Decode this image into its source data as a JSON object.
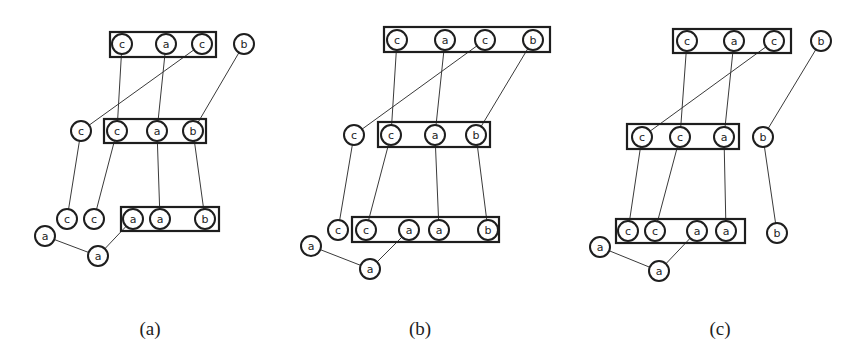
{
  "figure": {
    "node_radius": 10,
    "colors": {
      "stroke": "#1e1e1e",
      "edge": "#3a3a3a",
      "background": "#ffffff"
    },
    "panels": [
      {
        "id": "a",
        "caption": "(a)",
        "caption_pos": [
          150,
          328
        ],
        "boxes": [
          {
            "x": 110,
            "y": 32,
            "w": 106,
            "h": 25
          },
          {
            "x": 104,
            "y": 119,
            "w": 102,
            "h": 24
          },
          {
            "x": 121,
            "y": 207,
            "w": 98,
            "h": 24
          }
        ],
        "nodes": [
          {
            "id": "a_t1",
            "label": "c",
            "x": 122,
            "y": 44
          },
          {
            "id": "a_t2",
            "label": "a",
            "x": 166,
            "y": 44
          },
          {
            "id": "a_t3",
            "label": "c",
            "x": 202,
            "y": 44
          },
          {
            "id": "a_t4",
            "label": "b",
            "x": 244,
            "y": 44
          },
          {
            "id": "a_m0",
            "label": "c",
            "x": 81,
            "y": 131
          },
          {
            "id": "a_m1",
            "label": "c",
            "x": 117,
            "y": 131
          },
          {
            "id": "a_m2",
            "label": "a",
            "x": 157,
            "y": 131
          },
          {
            "id": "a_m3",
            "label": "b",
            "x": 193,
            "y": 131
          },
          {
            "id": "a_b0",
            "label": "c",
            "x": 67,
            "y": 219
          },
          {
            "id": "a_b1",
            "label": "c",
            "x": 94,
            "y": 219
          },
          {
            "id": "a_b2",
            "label": "a",
            "x": 133,
            "y": 219
          },
          {
            "id": "a_b3",
            "label": "a",
            "x": 160,
            "y": 219
          },
          {
            "id": "a_b4",
            "label": "b",
            "x": 205,
            "y": 219
          },
          {
            "id": "a_l1",
            "label": "a",
            "x": 45,
            "y": 236
          },
          {
            "id": "a_l2",
            "label": "a",
            "x": 98,
            "y": 256
          }
        ],
        "edges": [
          [
            "a_t1",
            "a_m1"
          ],
          [
            "a_t2",
            "a_m2"
          ],
          [
            "a_t3",
            "a_m0"
          ],
          [
            "a_t4",
            "a_m3"
          ],
          [
            "a_m0",
            "a_b0"
          ],
          [
            "a_m1",
            "a_b1"
          ],
          [
            "a_m2",
            "a_b3"
          ],
          [
            "a_m3",
            "a_b4"
          ],
          [
            "a_l1",
            "a_l2"
          ],
          [
            "a_l2",
            "a_b2"
          ]
        ]
      },
      {
        "id": "b",
        "caption": "(b)",
        "caption_pos": [
          420,
          328
        ],
        "boxes": [
          {
            "x": 384,
            "y": 27,
            "w": 166,
            "h": 25
          },
          {
            "x": 378,
            "y": 122,
            "w": 112,
            "h": 25
          },
          {
            "x": 352,
            "y": 217,
            "w": 147,
            "h": 25
          }
        ],
        "nodes": [
          {
            "id": "b_t1",
            "label": "c",
            "x": 397,
            "y": 40
          },
          {
            "id": "b_t2",
            "label": "a",
            "x": 445,
            "y": 40
          },
          {
            "id": "b_t3",
            "label": "c",
            "x": 485,
            "y": 40
          },
          {
            "id": "b_t4",
            "label": "b",
            "x": 533,
            "y": 40
          },
          {
            "id": "b_m0",
            "label": "c",
            "x": 354,
            "y": 135
          },
          {
            "id": "b_m1",
            "label": "c",
            "x": 391,
            "y": 135
          },
          {
            "id": "b_m2",
            "label": "a",
            "x": 435,
            "y": 135
          },
          {
            "id": "b_m3",
            "label": "b",
            "x": 476,
            "y": 135
          },
          {
            "id": "b_b0",
            "label": "c",
            "x": 338,
            "y": 230
          },
          {
            "id": "b_b1",
            "label": "c",
            "x": 366,
            "y": 230
          },
          {
            "id": "b_b2",
            "label": "a",
            "x": 409,
            "y": 230
          },
          {
            "id": "b_b3",
            "label": "a",
            "x": 439,
            "y": 230
          },
          {
            "id": "b_b4",
            "label": "b",
            "x": 488,
            "y": 230
          },
          {
            "id": "b_l1",
            "label": "a",
            "x": 311,
            "y": 246
          },
          {
            "id": "b_l2",
            "label": "a",
            "x": 370,
            "y": 269
          }
        ],
        "edges": [
          [
            "b_t1",
            "b_m1"
          ],
          [
            "b_t2",
            "b_m2"
          ],
          [
            "b_t3",
            "b_m0"
          ],
          [
            "b_t4",
            "b_m3"
          ],
          [
            "b_m0",
            "b_b0"
          ],
          [
            "b_m1",
            "b_b1"
          ],
          [
            "b_m2",
            "b_b3"
          ],
          [
            "b_m3",
            "b_b4"
          ],
          [
            "b_l1",
            "b_l2"
          ],
          [
            "b_l2",
            "b_b2"
          ]
        ]
      },
      {
        "id": "c",
        "caption": "(c)",
        "caption_pos": [
          720,
          328
        ],
        "boxes": [
          {
            "x": 673,
            "y": 29,
            "w": 118,
            "h": 24
          },
          {
            "x": 627,
            "y": 124,
            "w": 112,
            "h": 25
          },
          {
            "x": 616,
            "y": 219,
            "w": 129,
            "h": 24
          }
        ],
        "nodes": [
          {
            "id": "c_t1",
            "label": "c",
            "x": 687,
            "y": 41
          },
          {
            "id": "c_t2",
            "label": "a",
            "x": 734,
            "y": 41
          },
          {
            "id": "c_t3",
            "label": "c",
            "x": 774,
            "y": 41
          },
          {
            "id": "c_t4",
            "label": "b",
            "x": 821,
            "y": 41
          },
          {
            "id": "c_m1",
            "label": "c",
            "x": 642,
            "y": 137
          },
          {
            "id": "c_m2",
            "label": "c",
            "x": 680,
            "y": 137
          },
          {
            "id": "c_m3",
            "label": "a",
            "x": 724,
            "y": 137
          },
          {
            "id": "c_m4",
            "label": "b",
            "x": 763,
            "y": 137
          },
          {
            "id": "c_b1",
            "label": "c",
            "x": 628,
            "y": 231
          },
          {
            "id": "c_b2",
            "label": "c",
            "x": 655,
            "y": 231
          },
          {
            "id": "c_b3",
            "label": "a",
            "x": 697,
            "y": 231
          },
          {
            "id": "c_b4",
            "label": "a",
            "x": 726,
            "y": 231
          },
          {
            "id": "c_b5",
            "label": "b",
            "x": 777,
            "y": 233
          },
          {
            "id": "c_l1",
            "label": "a",
            "x": 600,
            "y": 247
          },
          {
            "id": "c_l2",
            "label": "a",
            "x": 659,
            "y": 271
          }
        ],
        "edges": [
          [
            "c_t1",
            "c_m2"
          ],
          [
            "c_t2",
            "c_m3"
          ],
          [
            "c_t3",
            "c_m1"
          ],
          [
            "c_t4",
            "c_m4"
          ],
          [
            "c_m1",
            "c_b1"
          ],
          [
            "c_m2",
            "c_b2"
          ],
          [
            "c_m3",
            "c_b4"
          ],
          [
            "c_m4",
            "c_b5"
          ],
          [
            "c_l1",
            "c_l2"
          ],
          [
            "c_l2",
            "c_b3"
          ]
        ]
      }
    ]
  }
}
